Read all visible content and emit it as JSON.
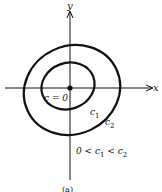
{
  "figure": {
    "axis_x_label": "x",
    "axis_y_label": "y",
    "origin_label": "c = 0",
    "contour_labels": [
      {
        "base": "c",
        "sub": "1"
      },
      {
        "base": "c",
        "sub": "2"
      }
    ],
    "inequality": {
      "p1": "0 < c",
      "s1": "1",
      "p2": " < c",
      "s2": "2"
    },
    "caption": "(a)",
    "colors": {
      "stroke": "#111111",
      "background": "#ffffff"
    }
  }
}
